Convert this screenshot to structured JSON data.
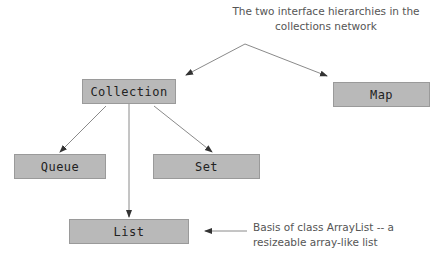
{
  "title_note": {
    "line1": "The two interface hierarchies in the",
    "line2": "collections network"
  },
  "nodes": {
    "collection": "Collection",
    "map": "Map",
    "queue": "Queue",
    "set": "Set",
    "list": "List"
  },
  "list_note": {
    "line1": "Basis of class ArrayList -- a",
    "line2": "resizeable array-like list"
  },
  "colors": {
    "box_fill": "#b9b9b9",
    "box_border": "#9a9a9a",
    "line": "#8a8a8a",
    "note_text": "#555555"
  }
}
